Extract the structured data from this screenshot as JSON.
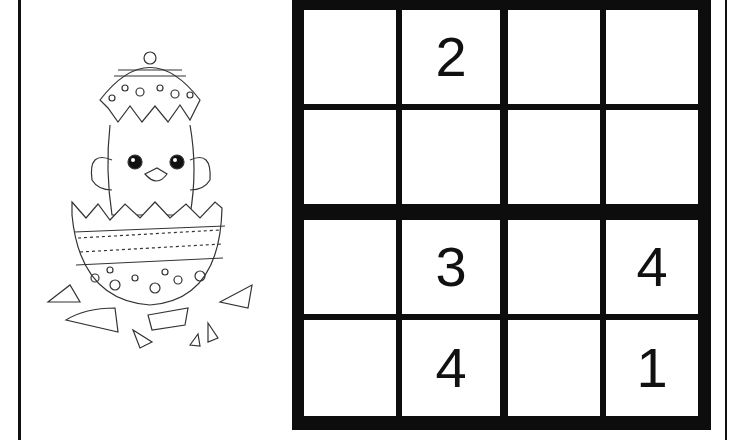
{
  "puzzle": {
    "type": "sudoku",
    "size": 4,
    "box_size": 2,
    "cells": [
      [
        "",
        "2",
        "",
        ""
      ],
      [
        "",
        "",
        "",
        ""
      ],
      [
        "",
        "3",
        "",
        "4"
      ],
      [
        "",
        "4",
        "",
        "1"
      ]
    ]
  },
  "illustration": {
    "subject": "chick-hatching-from-easter-egg"
  },
  "colors": {
    "grid_line": "#0d0d0d",
    "cell_bg": "#ffffff",
    "digit": "#111111"
  }
}
